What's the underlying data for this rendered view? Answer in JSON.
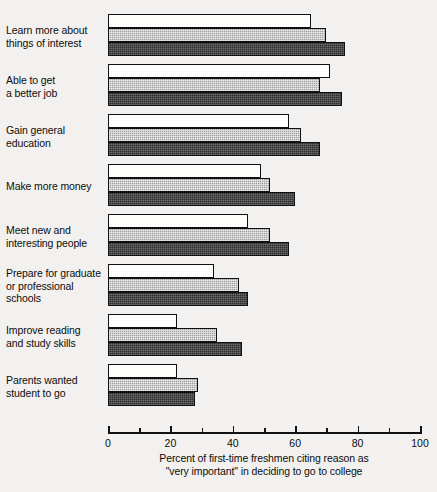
{
  "chart_data": {
    "type": "bar",
    "orientation": "horizontal",
    "title": "",
    "subtitle": "",
    "xlabel_lines": [
      "Percent of first-time freshmen citing reason as",
      "\"very important\" in deciding to go to college"
    ],
    "ylabel": "",
    "xlim": [
      0,
      100
    ],
    "xticks": [
      0,
      20,
      40,
      60,
      80,
      100
    ],
    "xtick_labels": [
      "0",
      "20",
      "40",
      "60",
      "80",
      "100"
    ],
    "xminor_ticks": [
      10,
      30,
      50,
      70,
      90
    ],
    "grid": false,
    "legend": false,
    "legend_position": "none",
    "categories": [
      "Learn more about things of interest",
      "Able to get a better job",
      "Gain general education",
      "Make more money",
      "Meet new and interesting people",
      "Prepare for graduate or professional schools",
      "Improve reading and study skills",
      "Parents wanted student to go"
    ],
    "category_label_lines": [
      [
        "Learn more about",
        "things of interest"
      ],
      [
        "Able to get",
        "a better job"
      ],
      [
        "Gain general",
        "education"
      ],
      [
        "Make more money"
      ],
      [
        "Meet new and",
        "interesting people"
      ],
      [
        "Prepare for graduate",
        "or professional",
        "schools"
      ],
      [
        "Improve reading",
        "and study skills"
      ],
      [
        "Parents wanted",
        "student to go"
      ]
    ],
    "series": [
      {
        "name": "series-1",
        "fill": "white",
        "color": "#fdfdfc",
        "values": [
          65,
          71,
          58,
          49,
          45,
          34,
          22,
          22
        ]
      },
      {
        "name": "series-2",
        "fill": "medium-gray",
        "color": "#9e9e9e",
        "values": [
          70,
          68,
          62,
          52,
          52,
          42,
          35,
          29
        ]
      },
      {
        "name": "series-3",
        "fill": "dark-gray",
        "color": "#2e2e2e",
        "values": [
          76,
          75,
          68,
          60,
          58,
          45,
          43,
          28
        ]
      }
    ]
  }
}
